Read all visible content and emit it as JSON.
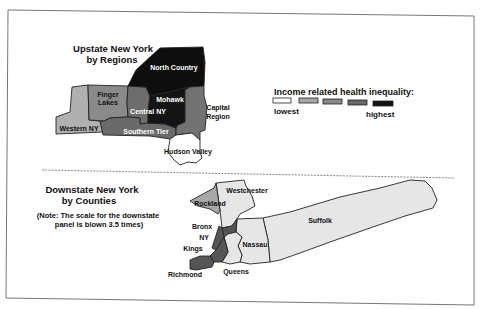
{
  "upstate": {
    "title_line1": "Upstate New York",
    "title_line2": "by Regions",
    "regions": {
      "north_country": "North Country",
      "mohawk": "Mohawk",
      "capital_line1": "Capital",
      "capital_line2": "Region",
      "finger_lakes_line1": "Finger",
      "finger_lakes_line2": "Lakes",
      "central_ny": "Central NY",
      "western_ny": "Western NY",
      "southern_tier": "Southern Tier",
      "hudson_valley": "Hudson Valley"
    }
  },
  "legend": {
    "title": "Income related health inequality:",
    "low_label": "lowest",
    "high_label": "highest",
    "colors": [
      "#ffffff",
      "#a8a8a8",
      "#888888",
      "#686868",
      "#111111"
    ]
  },
  "downstate": {
    "title_line1": "Downstate New York",
    "title_line2": "by Counties",
    "note_line1": "(Note: The scale for the downstate",
    "note_line2": "panel is blown 3.5 times)",
    "counties": {
      "westchester": "Westchester",
      "rockland": "Rockland",
      "suffolk": "Suffolk",
      "bronx": "Bronx",
      "ny": "NY",
      "kings": "Kings",
      "nassau": "Nassau",
      "richmond": "Richmond",
      "queens": "Queens"
    }
  }
}
